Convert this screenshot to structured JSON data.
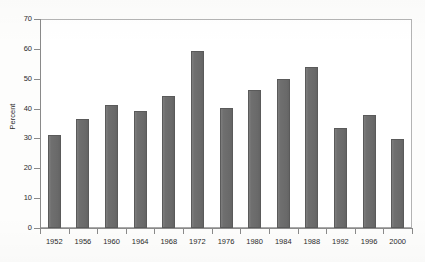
{
  "chart_data": {
    "type": "bar",
    "title": "",
    "subtitle": "",
    "xlabel": "",
    "ylabel": "Percent",
    "categories": [
      "1952",
      "1956",
      "1960",
      "1964",
      "1968",
      "1972",
      "1976",
      "1980",
      "1984",
      "1988",
      "1992",
      "1996",
      "2000"
    ],
    "values": [
      31.3,
      36.6,
      41.2,
      39.2,
      44.2,
      59.3,
      40.3,
      46.2,
      49.8,
      53.8,
      33.4,
      37.8,
      29.8
    ],
    "ylim": [
      0,
      70
    ],
    "y_ticks": [
      0,
      10,
      20,
      30,
      40,
      50,
      60,
      70
    ],
    "y_tick_labels": [
      "0",
      "10",
      "20",
      "30",
      "40",
      "50",
      "60",
      "70"
    ],
    "grid": false,
    "legend": null,
    "legend_position": "none",
    "series": [
      {
        "name": "Percent",
        "values": [
          31.3,
          36.6,
          41.2,
          39.2,
          44.2,
          59.3,
          40.3,
          46.2,
          49.8,
          53.8,
          33.4,
          37.8,
          29.8
        ]
      }
    ],
    "bar_color": "#6f6f6f",
    "bar_edge_color": "#5a5a5a",
    "axis_color": "#8a8a8a",
    "text_color": "#2b2b2b",
    "background_color": "#ffffff"
  }
}
